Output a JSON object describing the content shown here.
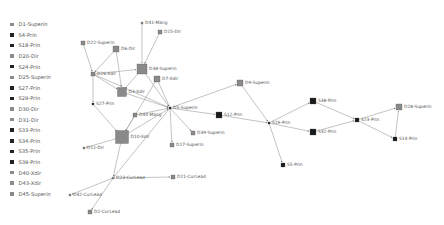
{
  "legend": {
    "items": [
      {
        "label": "D1-Superin",
        "color": "#8a8a8a"
      },
      {
        "label": "S4-Prin",
        "color": "#222222"
      },
      {
        "label": "S18-Prin",
        "color": "#222222"
      },
      {
        "label": "D20-Dir",
        "color": "#8a8a8a"
      },
      {
        "label": "S24-Prin",
        "color": "#222222"
      },
      {
        "label": "D25-Superin",
        "color": "#8a8a8a"
      },
      {
        "label": "S27-Prin",
        "color": "#222222"
      },
      {
        "label": "S29-Prin",
        "color": "#222222"
      },
      {
        "label": "D30-Dir",
        "color": "#8a8a8a"
      },
      {
        "label": "D31-Dir",
        "color": "#8a8a8a"
      },
      {
        "label": "S33-Prin",
        "color": "#222222"
      },
      {
        "label": "S34-Prin",
        "color": "#222222"
      },
      {
        "label": "S35-Prin",
        "color": "#222222"
      },
      {
        "label": "S39-Prin",
        "color": "#222222"
      },
      {
        "label": "D40-Xdir",
        "color": "#8a8a8a"
      },
      {
        "label": "D43-Xdir",
        "color": "#8a8a8a"
      },
      {
        "label": "D45-Superin",
        "color": "#8a8a8a"
      }
    ]
  },
  "graph": {
    "colors": {
      "dir": "#8a8a8a",
      "prin": "#1a1a1a",
      "edge": "#9a9a9a"
    },
    "nodes": [
      {
        "id": "D41",
        "label": "D41-Mang",
        "x": 142,
        "y": 23,
        "s": 2,
        "c": "dir"
      },
      {
        "id": "D15",
        "label": "D15-Dir",
        "x": 160,
        "y": 32,
        "s": 4,
        "c": "dir"
      },
      {
        "id": "D22",
        "label": "D22-Superin",
        "x": 83,
        "y": 43,
        "s": 4,
        "c": "dir"
      },
      {
        "id": "D6",
        "label": "D6-Dir",
        "x": 116,
        "y": 49,
        "s": 6,
        "c": "dir"
      },
      {
        "id": "D38",
        "label": "D38-Superin",
        "x": 142,
        "y": 69,
        "s": 10,
        "c": "dir"
      },
      {
        "id": "D26",
        "label": "D26-Xdir",
        "x": 93,
        "y": 74,
        "s": 4,
        "c": "dir"
      },
      {
        "id": "D7",
        "label": "D7-Xdir",
        "x": 157,
        "y": 79,
        "s": 6,
        "c": "dir"
      },
      {
        "id": "D9",
        "label": "D9-Superin",
        "x": 240,
        "y": 83,
        "s": 6,
        "c": "dir"
      },
      {
        "id": "D3",
        "label": "D3-Xdir",
        "x": 122,
        "y": 92,
        "s": 9,
        "c": "dir"
      },
      {
        "id": "S27",
        "label": "S27-Prin",
        "x": 93,
        "y": 104,
        "s": 2,
        "c": "prin"
      },
      {
        "id": "D5",
        "label": "D5-Superin",
        "x": 170,
        "y": 108,
        "s": 2,
        "c": "prin"
      },
      {
        "id": "D44",
        "label": "D44-Mang",
        "x": 135,
        "y": 115,
        "s": 4,
        "c": "dir"
      },
      {
        "id": "S12",
        "label": "S12-Prin",
        "x": 219,
        "y": 115,
        "s": 6,
        "c": "prin"
      },
      {
        "id": "S38",
        "label": "S38-Prin",
        "x": 313,
        "y": 101,
        "s": 6,
        "c": "prin"
      },
      {
        "id": "S19",
        "label": "S19-Prin",
        "x": 269,
        "y": 123,
        "s": 2,
        "c": "prin"
      },
      {
        "id": "S23",
        "label": "S23-Prin",
        "x": 357,
        "y": 120,
        "s": 4,
        "c": "prin"
      },
      {
        "id": "D28",
        "label": "D28-Superin",
        "x": 399,
        "y": 107,
        "s": 6,
        "c": "dir"
      },
      {
        "id": "S32",
        "label": "S32-Prin",
        "x": 313,
        "y": 132,
        "s": 6,
        "c": "prin"
      },
      {
        "id": "D10",
        "label": "D10-Xdir",
        "x": 122,
        "y": 137,
        "s": 13,
        "c": "dir"
      },
      {
        "id": "D11",
        "label": "D11-Dir",
        "x": 84,
        "y": 148,
        "s": 2,
        "c": "dir"
      },
      {
        "id": "D39",
        "label": "D39-Superin",
        "x": 193,
        "y": 133,
        "s": 4,
        "c": "dir"
      },
      {
        "id": "D17",
        "label": "D17-Superin",
        "x": 172,
        "y": 145,
        "s": 4,
        "c": "dir"
      },
      {
        "id": "S14",
        "label": "S14-Prin",
        "x": 395,
        "y": 139,
        "s": 4,
        "c": "prin"
      },
      {
        "id": "S5",
        "label": "S5-Prin",
        "x": 283,
        "y": 165,
        "s": 4,
        "c": "prin"
      },
      {
        "id": "D23",
        "label": "D23-CurLead",
        "x": 113,
        "y": 178,
        "s": 2,
        "c": "dir"
      },
      {
        "id": "D21",
        "label": "D21-CurLead",
        "x": 173,
        "y": 177,
        "s": 4,
        "c": "dir"
      },
      {
        "id": "D42",
        "label": "D42-CurLead",
        "x": 70,
        "y": 195,
        "s": 2,
        "c": "dir"
      },
      {
        "id": "D2",
        "label": "D2-CurLead",
        "x": 90,
        "y": 212,
        "s": 4,
        "c": "dir"
      }
    ],
    "edges": [
      [
        "D41",
        "D38"
      ],
      [
        "D15",
        "D38"
      ],
      [
        "D6",
        "D26"
      ],
      [
        "D6",
        "D3"
      ],
      [
        "D22",
        "D26"
      ],
      [
        "D26",
        "D38"
      ],
      [
        "D26",
        "D3"
      ],
      [
        "D26",
        "S27"
      ],
      [
        "D26",
        "D5"
      ],
      [
        "S27",
        "D10"
      ],
      [
        "D38",
        "D3"
      ],
      [
        "D38",
        "D5"
      ],
      [
        "D7",
        "D5"
      ],
      [
        "D7",
        "D10"
      ],
      [
        "D3",
        "D5"
      ],
      [
        "D44",
        "D5"
      ],
      [
        "D44",
        "D10"
      ],
      [
        "D10",
        "D5"
      ],
      [
        "D10",
        "D11"
      ],
      [
        "D10",
        "D23"
      ],
      [
        "D5",
        "D9"
      ],
      [
        "D5",
        "S12"
      ],
      [
        "D5",
        "D39"
      ],
      [
        "D5",
        "D17"
      ],
      [
        "D5",
        "D23"
      ],
      [
        "D9",
        "S19"
      ],
      [
        "S12",
        "S19"
      ],
      [
        "S19",
        "S38"
      ],
      [
        "S19",
        "S32"
      ],
      [
        "S19",
        "S5"
      ],
      [
        "S38",
        "S23"
      ],
      [
        "S32",
        "S23"
      ],
      [
        "S23",
        "D28"
      ],
      [
        "S23",
        "S14"
      ],
      [
        "S14",
        "D28"
      ],
      [
        "D23",
        "D21"
      ],
      [
        "D23",
        "D42"
      ],
      [
        "D23",
        "D2"
      ]
    ]
  }
}
